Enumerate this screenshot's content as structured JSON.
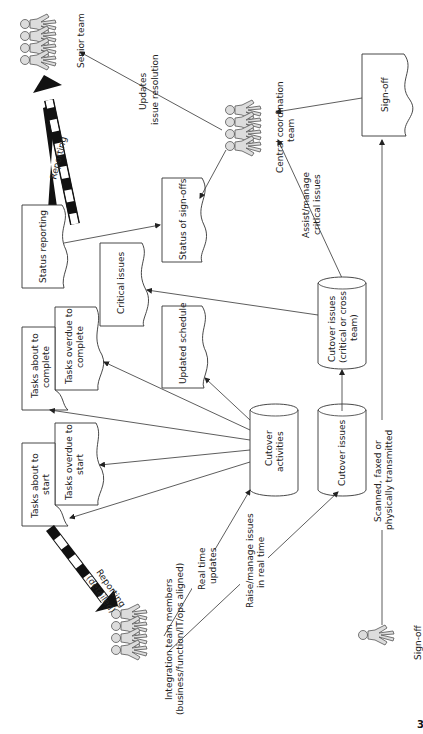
{
  "diagram": {
    "actors": {
      "senior_team": "Senior team",
      "central_coordination_team_line1": "Central coordination",
      "central_coordination_team_line2": "team",
      "integration_team_line1": "Integration team members",
      "integration_team_line2": "(business/function/IT/ops aligned)",
      "sign_off_person": "Sign-off"
    },
    "documents": {
      "status_reporting": "Status reporting",
      "status_of_sign_offs": "Status of sign-offs",
      "critical_issues": "Critical issues",
      "tasks_about_to_complete_line1": "Tasks about to",
      "tasks_about_to_complete_line2": "complete",
      "tasks_overdue_to_complete_line1": "Tasks overdue to",
      "tasks_overdue_to_complete_line2": "complete",
      "updated_schedule": "Updated schedule",
      "tasks_about_to_start_line1": "Tasks about to",
      "tasks_about_to_start_line2": "start",
      "tasks_overdue_to_start_line1": "Tasks overdue to",
      "tasks_overdue_to_start_line2": "start",
      "sign_off_doc": "Sign-off"
    },
    "databases": {
      "cutover_activities_line1": "Cutover",
      "cutover_activities_line2": "activities",
      "cutover_issues": "Cutover issues",
      "cutover_issues_critical_line1": "Cutover issues",
      "cutover_issues_critical_line2": "(critical or cross",
      "cutover_issues_critical_line3": "team)"
    },
    "edge_labels": {
      "reporting": "Reporting",
      "reporting_detailed_line1": "Reporting",
      "reporting_detailed_line2": "(detailed)",
      "updates_line1": "Updates",
      "updates_line2": "issue resolution",
      "assist_line1": "Assist/manage",
      "assist_line2": "critical issues",
      "real_time_line1": "Real time",
      "real_time_line2": "updates",
      "raise_line1": "Raise/manage issues",
      "raise_line2": "in real time",
      "scanned_line1": "Scanned, faxed or",
      "scanned_line2": "physically transmitted"
    },
    "page_number": "3"
  }
}
